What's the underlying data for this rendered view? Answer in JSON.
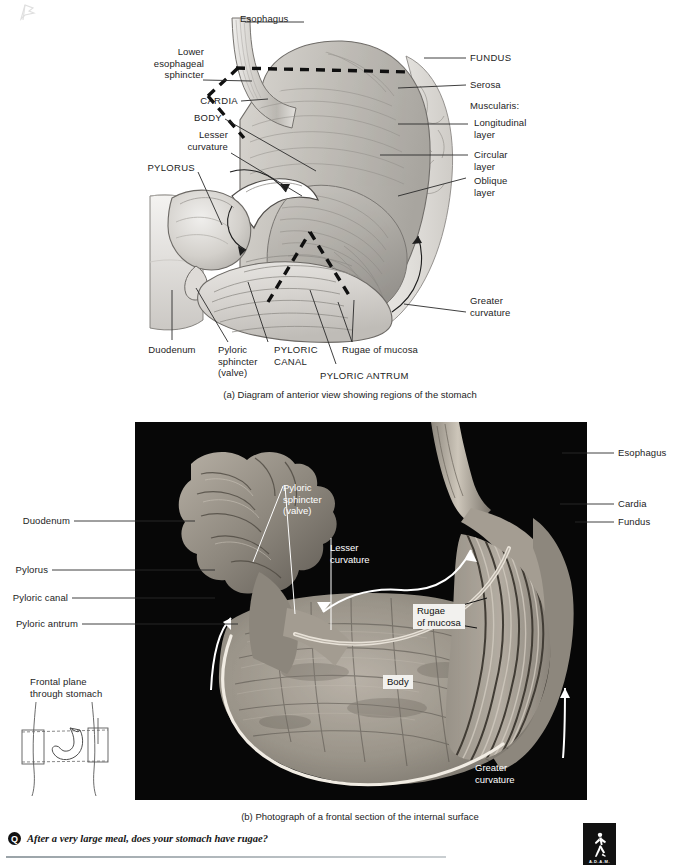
{
  "figure": {
    "panel_a": {
      "caption": "(a) Diagram of anterior view showing regions of the stomach",
      "labels_left": [
        {
          "text": "Lower\nesophageal\nsphincter",
          "style": "mixed"
        },
        {
          "text": "CARDIA",
          "style": "caps"
        },
        {
          "text": "BODY",
          "style": "caps"
        },
        {
          "text": "Lesser\ncurvature",
          "style": "mixed"
        },
        {
          "text": "PYLORUS",
          "style": "caps"
        }
      ],
      "labels_top": [
        {
          "text": "Esophagus",
          "style": "mixed"
        }
      ],
      "labels_right": [
        {
          "text": "FUNDUS",
          "style": "caps"
        },
        {
          "text": "Serosa",
          "style": "mixed"
        },
        {
          "text": "Muscularis:",
          "style": "mixed"
        },
        {
          "text": "Longitudinal\nlayer",
          "style": "mixed"
        },
        {
          "text": "Circular\nlayer",
          "style": "mixed"
        },
        {
          "text": "Oblique\nlayer",
          "style": "mixed"
        },
        {
          "text": "Greater\ncurvature",
          "style": "mixed"
        }
      ],
      "labels_bottom": [
        {
          "text": "Duodenum",
          "style": "mixed"
        },
        {
          "text": "Pyloric\nsphincter\n(valve)",
          "style": "mixed"
        },
        {
          "text": "PYLORIC\nCANAL",
          "style": "caps"
        },
        {
          "text": "Rugae of mucosa",
          "style": "mixed"
        },
        {
          "text": "PYLORIC ANTRUM",
          "style": "caps"
        }
      ]
    },
    "panel_b": {
      "caption": "(b) Photograph of a frontal section of the internal surface",
      "labels_left": [
        {
          "text": "Duodenum"
        },
        {
          "text": "Pylorus"
        },
        {
          "text": "Pyloric canal"
        },
        {
          "text": "Pyloric antrum"
        }
      ],
      "labels_right": [
        {
          "text": "Esophagus"
        },
        {
          "text": "Cardia"
        },
        {
          "text": "Fundus"
        }
      ],
      "labels_on_photo": [
        {
          "text": "Pyloric\nsphincter\n(valve)"
        },
        {
          "text": "Lesser\ncurvature"
        },
        {
          "text": "Greater\ncurvature"
        }
      ],
      "boxed_labels": [
        {
          "text": "Rugae\nof mucosa"
        },
        {
          "text": "Body"
        }
      ]
    },
    "inset": {
      "title": "Frontal plane\nthrough stomach"
    },
    "question": {
      "marker": "Q",
      "text": "After a very large meal, does your stomach have rugae?"
    },
    "logo": {
      "text": "A.D.A.M."
    }
  },
  "colors": {
    "photo_background": "#070707",
    "ink": "#1d1d1d",
    "leader": "#2a2a2a",
    "tissue_light": "#e9e7e4",
    "tissue_mid": "#c6c3bf",
    "tissue_dark": "#9a9792"
  }
}
